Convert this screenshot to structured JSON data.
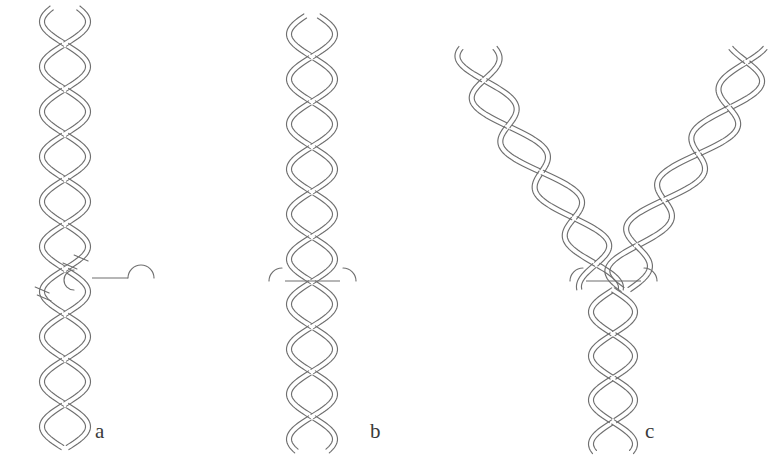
{
  "figure": {
    "background_color": "#ffffff",
    "stroke_color": "#6f6f6f",
    "label_color": "#3a3a3a",
    "width": 779,
    "height": 470
  },
  "panels": [
    {
      "id": "a",
      "label": "a",
      "label_x": 95,
      "label_y": 421,
      "description": "Continuous braid of two double-stranded ribbons with a nick site marked by short tick marks and a leader line ending in a semicircular cap",
      "center_x": 65,
      "annotation": {
        "type": "nick-site",
        "tick_count": 4,
        "leader_line_y": 278,
        "leader_line_x_start": 92,
        "leader_line_x_end": 128,
        "cap_arc_radius": 13,
        "cap_arc_center_x": 141,
        "cap_arc_center_y": 278
      }
    },
    {
      "id": "b",
      "label": "b",
      "label_x": 370,
      "label_y": 421,
      "description": "Continuous braid with a horizontal bridging bar joining the two ribbons, flanked by small outward arcs",
      "center_x": 312,
      "annotation": {
        "type": "bridge-bar",
        "bar_y": 281,
        "bar_x_start": 285,
        "bar_x_end": 340,
        "left_arc_center_x": 282,
        "right_arc_center_x": 343,
        "arc_radius": 13
      }
    },
    {
      "id": "c",
      "label": "c",
      "label_x": 645,
      "label_y": 421,
      "description": "Y-shaped replication fork: two braided arms converge at a junction with a horizontal bridging bar, continuing as a single braided stem below",
      "center_x": 613,
      "annotation": {
        "type": "fork-junction",
        "bar_y": 281,
        "bar_x_start": 586,
        "bar_x_end": 641,
        "left_arc_center_x": 583,
        "right_arc_center_x": 644,
        "arc_radius": 13
      },
      "arms": [
        {
          "side": "left",
          "tip_x": 478,
          "tip_y": 48
        },
        {
          "side": "right",
          "tip_x": 748,
          "tip_y": 48
        }
      ]
    }
  ],
  "geometry": {
    "braid_amplitude": 23,
    "braid_period": 90,
    "ribbon_gap": 5,
    "panel_a_top_y": 8,
    "panel_a_bottom_y": 448,
    "panel_b_top_y": 16,
    "panel_b_bottom_y": 452,
    "panel_c_stem_bottom_y": 452
  }
}
